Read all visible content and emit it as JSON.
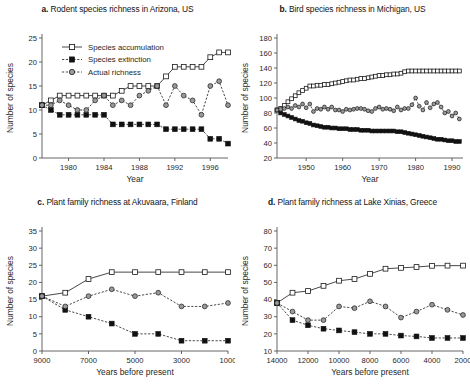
{
  "figure": {
    "background": "#ffffff",
    "ink": "#1a1a1a"
  },
  "legend": {
    "position": "inside-top-left-panel-a",
    "entries": [
      {
        "key": "accumulation",
        "label": "Species accumulation",
        "marker": "open-square",
        "line": "solid",
        "color": "#1a1a1a",
        "fill": "#ffffff"
      },
      {
        "key": "extinction",
        "label": "Species extinction",
        "marker": "filled-square",
        "line": "dashed",
        "color": "#1a1a1a",
        "fill": "#111111"
      },
      {
        "key": "actual",
        "label": "Actual richness",
        "marker": "grey-circle",
        "line": "dashed",
        "color": "#1a1a1a",
        "fill": "#9a9a9a"
      }
    ]
  },
  "panels": [
    {
      "id": "a",
      "letter": "a.",
      "title": "Rodent species richness in Arizona, US",
      "xlabel": "Year",
      "ylabel": "Number of species"
    },
    {
      "id": "b",
      "letter": "b.",
      "title": "Bird species richness in Michigan, US",
      "xlabel": "Year",
      "ylabel": "Number of species"
    },
    {
      "id": "c",
      "letter": "c.",
      "title": "Plant family richness at Akuvaara, Finland",
      "xlabel": "Years before present",
      "ylabel": "Number of species"
    },
    {
      "id": "d",
      "letter": "d.",
      "title": "Plant family richness at Lake Xinias, Greece",
      "xlabel": "Years before present",
      "ylabel": "Number of species"
    }
  ],
  "chart_data": [
    {
      "panel": "a",
      "type": "line",
      "title": "Rodent species richness in Arizona, US",
      "xlabel": "Year",
      "ylabel": "Number of species",
      "xlim": [
        1977,
        1998
      ],
      "ylim": [
        0,
        25
      ],
      "xticks": [
        1980,
        1984,
        1988,
        1992,
        1996
      ],
      "yticks": [
        0,
        5,
        10,
        15,
        20,
        25
      ],
      "grid": false,
      "legend": "top-left-inside",
      "x": [
        1977,
        1978,
        1979,
        1980,
        1981,
        1982,
        1983,
        1984,
        1985,
        1986,
        1987,
        1988,
        1989,
        1990,
        1991,
        1992,
        1993,
        1994,
        1995,
        1996,
        1997,
        1998
      ],
      "series": [
        {
          "name": "Species accumulation",
          "marker": "open-square",
          "values": [
            11,
            12,
            13,
            13,
            13,
            13,
            13,
            13,
            13,
            14,
            15,
            15,
            15,
            15,
            17,
            19,
            19,
            19,
            19,
            21,
            22,
            22
          ]
        },
        {
          "name": "Species extinction",
          "marker": "filled-square",
          "values": [
            11,
            10,
            9,
            9,
            9,
            9,
            9,
            9,
            7,
            7,
            7,
            7,
            7,
            7,
            6,
            6,
            6,
            6,
            6,
            4,
            4,
            3
          ]
        },
        {
          "name": "Actual richness",
          "marker": "grey-circle",
          "values": [
            11,
            11,
            12,
            11,
            10,
            10,
            12,
            13,
            11,
            12,
            11,
            13,
            14,
            15,
            11,
            15,
            13,
            12,
            9,
            15,
            16,
            11
          ]
        }
      ]
    },
    {
      "panel": "b",
      "type": "line",
      "title": "Bird species richness in Michigan, US",
      "xlabel": "Year",
      "ylabel": "Number of species",
      "xlim": [
        1942,
        1993
      ],
      "ylim": [
        20,
        180
      ],
      "xticks": [
        1950,
        1960,
        1970,
        1980,
        1990
      ],
      "yticks": [
        20,
        40,
        60,
        80,
        100,
        120,
        140,
        160,
        180
      ],
      "grid": false,
      "x": [
        1942,
        1943,
        1944,
        1945,
        1946,
        1947,
        1948,
        1949,
        1950,
        1951,
        1952,
        1953,
        1954,
        1955,
        1956,
        1957,
        1958,
        1959,
        1960,
        1961,
        1962,
        1963,
        1964,
        1965,
        1966,
        1967,
        1968,
        1969,
        1970,
        1971,
        1972,
        1973,
        1974,
        1975,
        1976,
        1977,
        1978,
        1979,
        1980,
        1981,
        1982,
        1983,
        1984,
        1985,
        1986,
        1987,
        1988,
        1989,
        1990,
        1991,
        1992
      ],
      "series": [
        {
          "name": "Species accumulation",
          "marker": "open-square",
          "values": [
            84,
            86,
            90,
            95,
            99,
            103,
            107,
            110,
            113,
            116,
            116,
            117,
            117,
            118,
            118,
            119,
            120,
            121,
            122,
            123,
            124,
            124,
            125,
            126,
            126,
            127,
            128,
            129,
            130,
            130,
            131,
            131,
            132,
            132,
            133,
            135,
            136,
            136,
            136,
            136,
            136,
            136,
            136,
            136,
            136,
            136,
            136,
            136,
            136,
            136,
            136
          ]
        },
        {
          "name": "Species extinction",
          "marker": "filled-square",
          "values": [
            84,
            80,
            78,
            76,
            74,
            72,
            70,
            69,
            67,
            66,
            64,
            63,
            62,
            61,
            61,
            60,
            60,
            59,
            59,
            59,
            58,
            58,
            58,
            57,
            57,
            57,
            56,
            56,
            56,
            56,
            56,
            56,
            56,
            55,
            55,
            54,
            53,
            52,
            51,
            50,
            49,
            48,
            47,
            46,
            45,
            45,
            44,
            43,
            43,
            42,
            42
          ]
        },
        {
          "name": "Actual richness",
          "marker": "grey-circle",
          "values": [
            84,
            85,
            86,
            88,
            86,
            90,
            88,
            92,
            87,
            92,
            82,
            86,
            85,
            88,
            85,
            88,
            84,
            84,
            82,
            85,
            84,
            85,
            86,
            86,
            85,
            83,
            82,
            86,
            88,
            85,
            86,
            85,
            83,
            88,
            84,
            86,
            86,
            91,
            100,
            89,
            84,
            94,
            87,
            92,
            94,
            88,
            80,
            82,
            76,
            80,
            72
          ]
        }
      ]
    },
    {
      "panel": "c",
      "type": "line",
      "title": "Plant family richness at Akuvaara, Finland",
      "xlabel": "Years before present",
      "ylabel": "Number of species",
      "xlim": [
        9000,
        1000
      ],
      "ylim": [
        0,
        35
      ],
      "xticks": [
        9000,
        7000,
        5000,
        3000,
        1000
      ],
      "yticks": [
        0,
        5,
        10,
        15,
        20,
        25,
        30,
        35
      ],
      "x_reversed": true,
      "grid": false,
      "x": [
        9000,
        8000,
        7000,
        6000,
        5000,
        4000,
        3000,
        2000,
        1000
      ],
      "series": [
        {
          "name": "Species accumulation",
          "marker": "open-square",
          "values": [
            16,
            17,
            21,
            23,
            23,
            23,
            23,
            23,
            23
          ]
        },
        {
          "name": "Species extinction",
          "marker": "filled-square",
          "values": [
            16,
            12,
            10,
            8,
            5,
            5,
            3,
            3,
            3
          ]
        },
        {
          "name": "Actual richness",
          "marker": "grey-circle",
          "values": [
            16,
            13,
            16,
            18,
            16,
            17,
            13,
            13,
            14
          ]
        }
      ]
    },
    {
      "panel": "d",
      "type": "line",
      "title": "Plant family richness at Lake Xinias, Greece",
      "xlabel": "Years before present",
      "ylabel": "Number of species",
      "xlim": [
        14000,
        2000
      ],
      "ylim": [
        10,
        80
      ],
      "xticks": [
        14000,
        12000,
        10000,
        8000,
        6000,
        4000,
        2000
      ],
      "yticks": [
        10,
        20,
        30,
        40,
        50,
        60,
        70,
        80
      ],
      "x_reversed": true,
      "grid": false,
      "x": [
        14000,
        13000,
        12000,
        11000,
        10000,
        9000,
        8000,
        7000,
        6000,
        5000,
        4000,
        3000,
        2000
      ],
      "series": [
        {
          "name": "Species accumulation",
          "marker": "open-square",
          "values": [
            38,
            44,
            45,
            48,
            51,
            52,
            55,
            58,
            58.5,
            59,
            59.7,
            59.8,
            59.8
          ]
        },
        {
          "name": "Species extinction",
          "marker": "filled-square",
          "values": [
            38,
            28,
            25,
            23,
            22,
            21,
            20,
            20,
            19,
            18.5,
            17.6,
            17.6,
            17.6
          ]
        },
        {
          "name": "Actual richness",
          "marker": "grey-circle",
          "values": [
            38,
            33,
            28,
            28,
            36,
            35,
            39,
            36,
            29.5,
            33,
            37,
            34,
            31
          ]
        }
      ]
    }
  ]
}
